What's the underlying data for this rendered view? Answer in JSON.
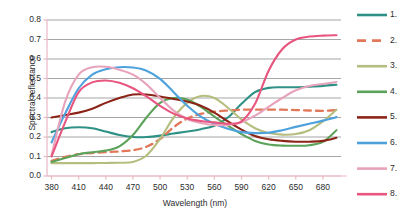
{
  "chart_data": {
    "type": "line",
    "title": "",
    "xlabel": "Wavelength (nm)",
    "ylabel": "Spectral reflectance",
    "xlim": [
      375,
      700
    ],
    "ylim": [
      0.0,
      0.8
    ],
    "grid": true,
    "legend_position": "right",
    "xticks": [
      "380",
      "410",
      "440",
      "470",
      "500",
      "530",
      "560",
      "590",
      "620",
      "650",
      "680"
    ],
    "yticks": [
      "0.0",
      "0.1",
      "0.2",
      "0.3",
      "0.4",
      "0.5",
      "0.6",
      "0.7",
      "0.8"
    ],
    "x": [
      380,
      395,
      410,
      425,
      440,
      455,
      470,
      485,
      500,
      515,
      530,
      545,
      560,
      575,
      590,
      605,
      620,
      635,
      650,
      665,
      680,
      695
    ],
    "series": [
      {
        "name": "1.",
        "color": "#2e9185",
        "dash": false,
        "values": [
          0.225,
          0.245,
          0.25,
          0.245,
          0.228,
          0.21,
          0.2,
          0.2,
          0.207,
          0.218,
          0.228,
          0.24,
          0.258,
          0.3,
          0.37,
          0.43,
          0.452,
          0.455,
          0.455,
          0.458,
          0.462,
          0.468
        ]
      },
      {
        "name": "2.",
        "color": "#e2785a",
        "dash": true,
        "values": [
          0.078,
          0.098,
          0.112,
          0.118,
          0.122,
          0.126,
          0.132,
          0.15,
          0.19,
          0.25,
          0.295,
          0.318,
          0.33,
          0.336,
          0.34,
          0.34,
          0.34,
          0.34,
          0.338,
          0.336,
          0.334,
          0.338
        ]
      },
      {
        "name": "3.",
        "color": "#b6be7f",
        "dash": false,
        "values": [
          0.066,
          0.066,
          0.066,
          0.066,
          0.067,
          0.068,
          0.072,
          0.105,
          0.19,
          0.3,
          0.375,
          0.41,
          0.4,
          0.35,
          0.29,
          0.245,
          0.22,
          0.212,
          0.215,
          0.235,
          0.28,
          0.34
        ]
      },
      {
        "name": "4.",
        "color": "#5ba25a",
        "dash": false,
        "values": [
          0.072,
          0.092,
          0.112,
          0.122,
          0.13,
          0.152,
          0.21,
          0.3,
          0.375,
          0.4,
          0.392,
          0.355,
          0.305,
          0.258,
          0.215,
          0.18,
          0.162,
          0.156,
          0.155,
          0.158,
          0.175,
          0.235
        ]
      },
      {
        "name": "5.",
        "color": "#8b2417",
        "dash": false,
        "values": [
          0.3,
          0.312,
          0.325,
          0.345,
          0.375,
          0.4,
          0.418,
          0.418,
          0.408,
          0.395,
          0.382,
          0.36,
          0.325,
          0.28,
          0.238,
          0.205,
          0.188,
          0.18,
          0.176,
          0.176,
          0.18,
          0.196
        ]
      },
      {
        "name": "6.",
        "color": "#4da2dd",
        "dash": false,
        "values": [
          0.172,
          0.32,
          0.45,
          0.52,
          0.548,
          0.558,
          0.556,
          0.54,
          0.498,
          0.43,
          0.36,
          0.305,
          0.268,
          0.242,
          0.225,
          0.22,
          0.222,
          0.235,
          0.252,
          0.268,
          0.284,
          0.302
        ]
      },
      {
        "name": "7.",
        "color": "#e7a3bc",
        "dash": false,
        "values": [
          0.105,
          0.38,
          0.52,
          0.558,
          0.56,
          0.545,
          0.52,
          0.47,
          0.4,
          0.335,
          0.292,
          0.272,
          0.262,
          0.262,
          0.275,
          0.31,
          0.355,
          0.4,
          0.44,
          0.462,
          0.472,
          0.482
        ]
      },
      {
        "name": "8.",
        "color": "#e8557f",
        "dash": false,
        "values": [
          0.1,
          0.275,
          0.43,
          0.48,
          0.49,
          0.478,
          0.45,
          0.408,
          0.36,
          0.32,
          0.295,
          0.282,
          0.275,
          0.268,
          0.28,
          0.37,
          0.54,
          0.65,
          0.7,
          0.715,
          0.72,
          0.722
        ]
      }
    ]
  },
  "legend": {
    "entries": [
      {
        "label": "1.",
        "color": "#2e9185",
        "dash": false
      },
      {
        "label": "2.",
        "color": "#e2785a",
        "dash": true
      },
      {
        "label": "3.",
        "color": "#b6be7f",
        "dash": false
      },
      {
        "label": "4.",
        "color": "#5ba25a",
        "dash": false
      },
      {
        "label": "5.",
        "color": "#8b2417",
        "dash": false
      },
      {
        "label": "6.",
        "color": "#4da2dd",
        "dash": false
      },
      {
        "label": "7.",
        "color": "#e7a3bc",
        "dash": false
      },
      {
        "label": "8.",
        "color": "#e8557f",
        "dash": false
      }
    ]
  },
  "style": {
    "grid_color": "#808080",
    "axis_color": "#e9b9c4",
    "text_color": "#2b2b2b",
    "background": "#ffffff"
  }
}
